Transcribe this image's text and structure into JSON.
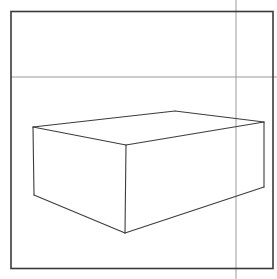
{
  "canvas": {
    "width": 277,
    "height": 279,
    "background_color": "#ffffff",
    "title": "Perspective Box Sketch"
  },
  "frame": {
    "name": "page-border",
    "stroke_color": "#3a3a3a",
    "stroke_width": 1.6,
    "x": 11,
    "y": 11.5,
    "width": 262,
    "height": 257
  },
  "guides": {
    "stroke_color": "#9a9a9a",
    "stroke_width": 1,
    "horizon_line": {
      "name": "horizon-guide-line",
      "x1": 11,
      "y1": 77,
      "x2": 277,
      "y2": 77,
      "label": "horizon"
    },
    "vertical_line": {
      "name": "vertical-guide-line",
      "x1": 236,
      "y1": 0,
      "x2": 236,
      "y2": 279,
      "label": "vertical"
    }
  },
  "box": {
    "name": "perspective-box",
    "stroke_color": "#3c3c3c",
    "stroke_width": 1.1,
    "fill": "none",
    "vertices": {
      "top_left": [
        33,
        127
      ],
      "top_back": [
        175,
        111
      ],
      "top_right": [
        264,
        122
      ],
      "top_front": [
        126,
        145
      ],
      "bottom_left": [
        34,
        195
      ],
      "bottom_right": [
        264,
        187
      ],
      "bottom_front": [
        125,
        233
      ]
    },
    "faces": [
      {
        "name": "top-face",
        "points": "33,127 175,111 264,122 126,145"
      },
      {
        "name": "left-front-face",
        "points": "33,127 126,145 125,233 34,195"
      },
      {
        "name": "right-front-face",
        "points": "126,145 264,122 264,187 125,233"
      }
    ],
    "edges": [
      {
        "name": "edge-top-left-to-back",
        "x1": 33,
        "y1": 127,
        "x2": 175,
        "y2": 111
      },
      {
        "name": "edge-top-back-to-right",
        "x1": 175,
        "y1": 111,
        "x2": 264,
        "y2": 122
      },
      {
        "name": "edge-top-right-to-front",
        "x1": 264,
        "y1": 122,
        "x2": 126,
        "y2": 145
      },
      {
        "name": "edge-top-front-to-left",
        "x1": 126,
        "y1": 145,
        "x2": 33,
        "y2": 127
      },
      {
        "name": "edge-vertical-left",
        "x1": 33,
        "y1": 127,
        "x2": 34,
        "y2": 195
      },
      {
        "name": "edge-vertical-front",
        "x1": 126,
        "y1": 145,
        "x2": 125,
        "y2": 233
      },
      {
        "name": "edge-vertical-right",
        "x1": 264,
        "y1": 122,
        "x2": 264,
        "y2": 187
      },
      {
        "name": "edge-bottom-left-front",
        "x1": 34,
        "y1": 195,
        "x2": 125,
        "y2": 233
      },
      {
        "name": "edge-bottom-front-right",
        "x1": 125,
        "y1": 233,
        "x2": 264,
        "y2": 187
      }
    ]
  }
}
